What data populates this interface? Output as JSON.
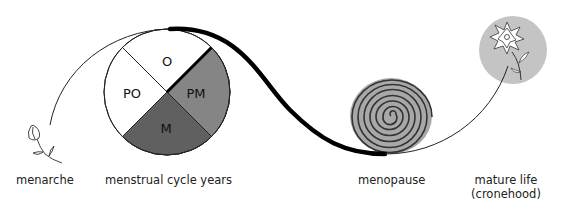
{
  "diagram": {
    "stages": [
      {
        "id": "menarche",
        "label": "menarche",
        "icon": "flower-bud-icon"
      },
      {
        "id": "menstrual",
        "label": "menstrual cycle years",
        "icon": "cycle-pie-icon"
      },
      {
        "id": "menopause",
        "label": "menopause",
        "icon": "spiral-icon"
      },
      {
        "id": "mature",
        "label_line1": "mature life",
        "label_line2": "(cronehood)",
        "icon": "blooming-flower-icon"
      }
    ],
    "cycle_segments": [
      {
        "label": "O",
        "color": "#ffffff"
      },
      {
        "label": "PM",
        "color": "#858585"
      },
      {
        "label": "M",
        "color": "#606060"
      },
      {
        "label": "PO",
        "color": "#ffffff"
      }
    ],
    "colors": {
      "line": "#111111",
      "spiral_fill": "#a8a8a8",
      "mature_circle": "#c4c4c4"
    }
  }
}
